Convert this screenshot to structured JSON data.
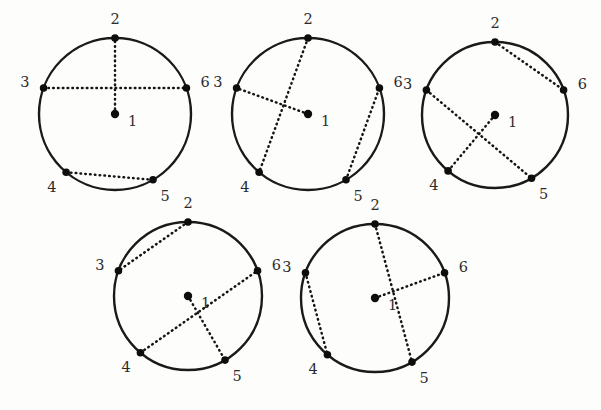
{
  "figure": {
    "background_color": "#fdfdfc",
    "stroke_color": "#1a1a1a",
    "chord_style": "dotted",
    "vertex_count": 6,
    "center_vertex_label": "1",
    "rim_vertex_labels": [
      "2",
      "3",
      "4",
      "5",
      "6"
    ]
  },
  "chart_data": {
    "type": "diagram",
    "layout": {
      "rows": [
        3,
        2
      ],
      "panel_count": 5
    },
    "vertex_labels": [
      "1",
      "2",
      "3",
      "4",
      "5",
      "6"
    ],
    "vertex_positions": {
      "1": {
        "role": "center",
        "angle_deg": null
      },
      "2": {
        "role": "rim",
        "angle_deg": 90
      },
      "3": {
        "role": "rim",
        "angle_deg": 160
      },
      "4": {
        "role": "rim",
        "angle_deg": 230
      },
      "5": {
        "role": "rim",
        "angle_deg": 300
      },
      "6": {
        "role": "rim",
        "angle_deg": 20
      }
    },
    "panels": [
      {
        "index": 1,
        "cx": 115,
        "cy": 114,
        "r": 76,
        "rotation_deg": 0,
        "edges": [
          [
            "1",
            "2"
          ],
          [
            "3",
            "6"
          ],
          [
            "4",
            "5"
          ]
        ]
      },
      {
        "index": 2,
        "cx": 308,
        "cy": 114,
        "r": 76,
        "rotation_deg": 0,
        "edges": [
          [
            "2",
            "4"
          ],
          [
            "1",
            "3"
          ],
          [
            "5",
            "6"
          ]
        ]
      },
      {
        "index": 3,
        "cx": 495,
        "cy": 115,
        "r": 73,
        "rotation_deg": 0,
        "edges": [
          [
            "2",
            "6"
          ],
          [
            "3",
            "5"
          ],
          [
            "1",
            "4"
          ]
        ]
      },
      {
        "index": 4,
        "cx": 188,
        "cy": 296,
        "r": 74,
        "rotation_deg": 0,
        "edges": [
          [
            "2",
            "3"
          ],
          [
            "4",
            "6"
          ],
          [
            "1",
            "5"
          ]
        ]
      },
      {
        "index": 5,
        "cx": 375,
        "cy": 298,
        "r": 74,
        "rotation_deg": 0,
        "edges": [
          [
            "2",
            "5"
          ],
          [
            "3",
            "4"
          ],
          [
            "1",
            "6"
          ]
        ]
      }
    ]
  }
}
